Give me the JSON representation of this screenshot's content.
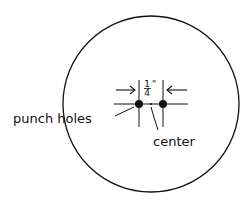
{
  "diagram": {
    "type": "punch-hole-placement",
    "labels": {
      "punch_holes": "punch holes",
      "center": "center",
      "spacing_numerator": "1",
      "spacing_denominator": "4",
      "spacing_unit": "\""
    },
    "colors": {
      "stroke": "#111111",
      "background": "#ffffff"
    },
    "circle": {
      "cx": 151,
      "cy": 104,
      "r": 88
    },
    "holes": [
      {
        "cx": 139,
        "cy": 104,
        "r": 4
      },
      {
        "cx": 163,
        "cy": 104,
        "r": 4
      }
    ],
    "center_point": {
      "cx": 151,
      "cy": 104
    },
    "spacing": "1/4 inch"
  }
}
